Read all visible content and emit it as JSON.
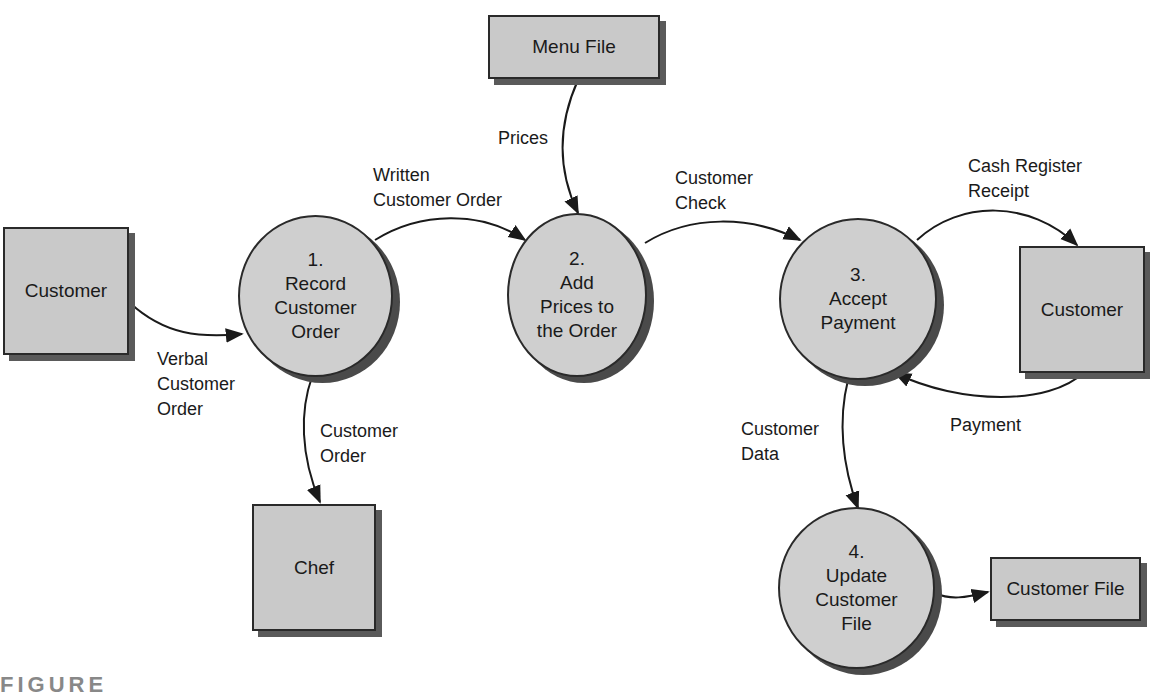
{
  "diagram": {
    "type": "data-flow-diagram",
    "entities": [
      {
        "id": "customer_left",
        "label": "Customer"
      },
      {
        "id": "menu_file",
        "label": "Menu File"
      },
      {
        "id": "chef",
        "label": "Chef"
      },
      {
        "id": "customer_right",
        "label": "Customer"
      },
      {
        "id": "customer_file",
        "label": "Customer File"
      }
    ],
    "processes": [
      {
        "id": "p1",
        "number": "1.",
        "lines": [
          "Record",
          "Customer",
          "Order"
        ]
      },
      {
        "id": "p2",
        "number": "2.",
        "lines": [
          "Add",
          "Prices to",
          "the Order"
        ]
      },
      {
        "id": "p3",
        "number": "3.",
        "lines": [
          "Accept",
          "Payment"
        ]
      },
      {
        "id": "p4",
        "number": "4.",
        "lines": [
          "Update",
          "Customer",
          "File"
        ]
      }
    ],
    "flows": [
      {
        "from": "customer_left",
        "to": "p1",
        "label": "Verbal\nCustomer\nOrder"
      },
      {
        "from": "p1",
        "to": "p2",
        "label": "Written\nCustomer Order"
      },
      {
        "from": "menu_file",
        "to": "p2",
        "label": "Prices"
      },
      {
        "from": "p1",
        "to": "chef",
        "label": "Customer\nOrder"
      },
      {
        "from": "p2",
        "to": "p3",
        "label": "Customer\nCheck"
      },
      {
        "from": "p3",
        "to": "customer_right",
        "label": "Cash Register\nReceipt"
      },
      {
        "from": "customer_right",
        "to": "p3",
        "label": "Payment"
      },
      {
        "from": "p3",
        "to": "p4",
        "label": "Customer\nData"
      },
      {
        "from": "p4",
        "to": "customer_file",
        "label": ""
      }
    ]
  },
  "caption": "FIGURE"
}
